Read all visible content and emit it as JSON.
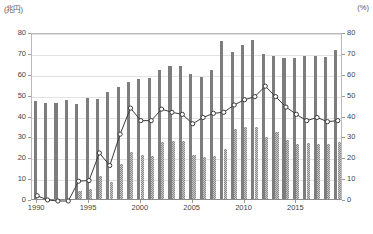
{
  "chart": {
    "unit_left": "(兆円)",
    "unit_right": "(%)",
    "y_ticks": [
      "0",
      "10",
      "20",
      "30",
      "40",
      "50",
      "60",
      "70",
      "80"
    ],
    "y_ticks_right": [
      "0",
      "10",
      "20",
      "30",
      "40",
      "50",
      "60",
      "70",
      "80"
    ],
    "x_ticks": [
      "1990",
      "1995",
      "2000",
      "2005",
      "2010",
      "2015"
    ],
    "colors": {
      "series1_bar": "#7d7d7d",
      "series2_bar": "#c9c9c9",
      "line": "#3a3a3a",
      "marker_fill": "#ffffff",
      "grid": "#e2e2e2",
      "axis": "#8c8c8c"
    }
  },
  "chart_data": {
    "type": "bar",
    "title": "",
    "subtitle": "",
    "xlabel": "",
    "ylabel": "(兆円)",
    "y2label": "(%)",
    "ylim": [
      0,
      80
    ],
    "y2lim": [
      0,
      80
    ],
    "grid": true,
    "legend": "none",
    "categories": [
      "1990",
      "1991",
      "1992",
      "1993",
      "1994",
      "1995",
      "1996",
      "1997",
      "1998",
      "1999",
      "2000",
      "2001",
      "2002",
      "2003",
      "2004",
      "2005",
      "2006",
      "2007",
      "2008",
      "2009",
      "2010",
      "2011",
      "2012",
      "2013",
      "2014",
      "2015",
      "2016",
      "2017",
      "2018",
      "2019"
    ],
    "series": [
      {
        "name": "総額",
        "type": "bar",
        "axis": "left",
        "style": "solid-gray",
        "values": [
          46.8,
          46.2,
          46.1,
          47.4,
          45.5,
          48.2,
          48.0,
          51.3,
          53.5,
          56.2,
          57.6,
          58.0,
          62.0,
          63.5,
          63.5,
          60.0,
          58.5,
          62.0,
          75.5,
          70.5,
          74.0,
          76.0,
          69.5,
          68.5,
          67.5,
          67.5,
          68.5,
          68.5,
          68.0,
          71.5
        ]
      },
      {
        "name": "うち一般会計",
        "type": "bar",
        "axis": "left",
        "style": "checkered",
        "values": [
          0.0,
          0.0,
          0.0,
          0.0,
          4.0,
          4.7,
          11.0,
          8.3,
          17.0,
          22.5,
          21.0,
          20.5,
          27.5,
          28.0,
          28.0,
          21.0,
          20.0,
          20.5,
          24.0,
          33.5,
          34.5,
          34.5,
          29.5,
          32.0,
          28.5,
          26.5,
          27.0,
          26.5,
          26.5,
          27.5
        ]
      },
      {
        "name": "比率",
        "type": "line",
        "axis": "right",
        "marker": "circle-open",
        "values": [
          2.5,
          0.5,
          0.0,
          0.0,
          9.5,
          9.8,
          23.0,
          17.0,
          32.0,
          44.5,
          38.5,
          38.5,
          44.0,
          42.5,
          41.5,
          37.0,
          40.0,
          42.0,
          42.5,
          46.0,
          48.5,
          50.0,
          55.0,
          50.0,
          45.0,
          41.5,
          38.5,
          40.0,
          38.0,
          38.5
        ]
      }
    ]
  }
}
